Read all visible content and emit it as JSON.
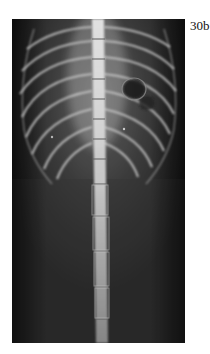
{
  "figure": {
    "label": "30b",
    "colors": {
      "background": "#1a1a1a",
      "bone": "#f2f2f2",
      "soft_tissue": "#5a5a5a"
    }
  }
}
